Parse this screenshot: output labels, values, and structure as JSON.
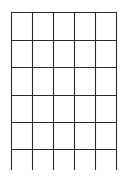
{
  "diagram": {
    "type": "grid",
    "columns": 5,
    "rows_closed": 5,
    "rows_open_bottom": 1,
    "line_color": "#2a2a2a",
    "background": "#ffffff",
    "vertical_lines_x": [
      11,
      32,
      53,
      74,
      95,
      116
    ],
    "horizontal_lines_y": [
      12,
      40,
      67,
      95,
      122,
      149
    ],
    "vertical_line_bottom_y": 170
  }
}
